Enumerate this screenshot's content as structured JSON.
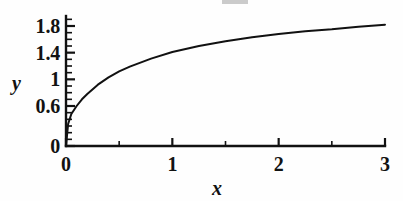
{
  "chart_data": {
    "type": "line",
    "title": "",
    "xlabel": "x",
    "ylabel": "y",
    "xlim": [
      0,
      3
    ],
    "ylim": [
      0,
      1.95
    ],
    "grid": false,
    "legend": null,
    "x_ticks": [
      "0",
      "1",
      "2",
      "3"
    ],
    "x_tick_values": [
      0,
      1,
      2,
      3
    ],
    "x_minor_step": 0.5,
    "y_ticks": [
      "0",
      "0.6",
      "1",
      "1.4",
      "1.8"
    ],
    "y_tick_values": [
      0,
      0.6,
      1,
      1.4,
      1.8
    ],
    "y_minor_step": 0.1,
    "series": [
      {
        "name": "curve",
        "color": "#111111",
        "x": [
          0,
          0.02,
          0.05,
          0.1,
          0.15,
          0.2,
          0.3,
          0.4,
          0.5,
          0.6,
          0.8,
          1.0,
          1.25,
          1.5,
          1.75,
          2.0,
          2.25,
          2.5,
          2.75,
          3.0
        ],
        "y": [
          0,
          0.33,
          0.48,
          0.6,
          0.7,
          0.78,
          0.92,
          1.03,
          1.12,
          1.19,
          1.31,
          1.41,
          1.5,
          1.57,
          1.63,
          1.68,
          1.72,
          1.75,
          1.79,
          1.82
        ]
      }
    ]
  },
  "axis_titles": {
    "x": "x",
    "y": "y"
  }
}
